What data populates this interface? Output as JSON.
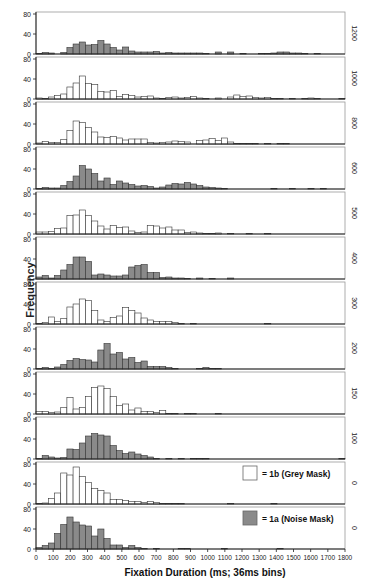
{
  "chart_data": {
    "type": "bar",
    "title": "",
    "xlabel": "Fixation Duration (ms; 36ms bins)",
    "ylabel": "Frequency",
    "right_label": "Scene Onset Delay (ms)",
    "xlim": [
      0,
      1800
    ],
    "ylim": [
      0,
      80
    ],
    "bin_width_ms": 36,
    "x_ticks": [
      0,
      100,
      200,
      300,
      400,
      500,
      600,
      700,
      800,
      900,
      1000,
      1100,
      1200,
      1300,
      1400,
      1500,
      1600,
      1700,
      1800
    ],
    "y_ticks": [
      0,
      40,
      80
    ],
    "legend": [
      {
        "label": "= 1b (Grey Mask)",
        "color": "#ffffff"
      },
      {
        "label": "= 1a (Noise Mask)",
        "color": "#8a8a8a"
      }
    ],
    "panels": [
      {
        "delay": "1200",
        "condition": "1a",
        "values": [
          1,
          3,
          2,
          0,
          3,
          13,
          20,
          24,
          18,
          19,
          27,
          20,
          13,
          8,
          14,
          6,
          4,
          4,
          4,
          5,
          2,
          3,
          2,
          2,
          2,
          2,
          2,
          1,
          0,
          4,
          0,
          4,
          0,
          1,
          0,
          0,
          1,
          1,
          2,
          4,
          4,
          2,
          2,
          1,
          0,
          1,
          0,
          0,
          0,
          0
        ]
      },
      {
        "delay": "1000",
        "condition": "1b",
        "values": [
          2,
          1,
          4,
          7,
          10,
          24,
          32,
          46,
          31,
          29,
          15,
          14,
          17,
          5,
          9,
          7,
          4,
          5,
          6,
          2,
          1,
          3,
          4,
          2,
          3,
          5,
          2,
          1,
          0,
          2,
          0,
          4,
          8,
          5,
          6,
          3,
          2,
          3,
          1,
          1,
          0,
          1,
          0,
          1,
          2,
          1,
          0,
          0,
          0,
          1
        ]
      },
      {
        "delay": "800",
        "condition": "1b",
        "values": [
          2,
          5,
          3,
          3,
          9,
          27,
          46,
          43,
          33,
          24,
          14,
          13,
          15,
          12,
          8,
          10,
          10,
          10,
          3,
          2,
          3,
          4,
          6,
          5,
          4,
          0,
          7,
          8,
          11,
          7,
          12,
          4,
          1,
          1,
          1,
          1,
          0,
          1,
          0,
          1,
          1,
          0,
          0,
          0,
          0,
          0,
          0,
          0,
          0,
          0
        ]
      },
      {
        "delay": "600",
        "condition": "1a",
        "values": [
          1,
          3,
          2,
          2,
          7,
          15,
          26,
          47,
          40,
          31,
          16,
          22,
          9,
          16,
          12,
          9,
          6,
          7,
          5,
          2,
          4,
          8,
          11,
          10,
          13,
          10,
          7,
          4,
          3,
          2,
          1,
          0,
          0,
          0,
          0,
          0,
          0,
          0,
          1,
          0,
          0,
          1,
          0,
          0,
          1,
          0,
          1,
          0,
          0,
          0
        ]
      },
      {
        "delay": "500",
        "condition": "1b",
        "values": [
          4,
          4,
          5,
          11,
          12,
          37,
          38,
          48,
          37,
          26,
          16,
          10,
          17,
          13,
          14,
          6,
          3,
          4,
          17,
          16,
          12,
          14,
          8,
          8,
          3,
          4,
          2,
          1,
          1,
          2,
          0,
          1,
          0,
          0,
          1,
          0,
          0,
          1,
          0,
          0,
          0,
          0,
          0,
          0,
          0,
          0,
          0,
          0,
          0,
          0
        ]
      },
      {
        "delay": "400",
        "condition": "1a",
        "values": [
          4,
          7,
          2,
          7,
          18,
          29,
          44,
          44,
          35,
          8,
          10,
          8,
          6,
          6,
          8,
          24,
          27,
          29,
          13,
          13,
          3,
          4,
          2,
          2,
          1,
          0,
          2,
          0,
          1,
          0,
          0,
          2,
          0,
          0,
          0,
          0,
          0,
          0,
          0,
          0,
          0,
          0,
          0,
          0,
          0,
          0,
          0,
          0,
          0,
          0
        ]
      },
      {
        "delay": "300",
        "condition": "1b",
        "values": [
          1,
          3,
          14,
          5,
          11,
          34,
          40,
          50,
          47,
          27,
          8,
          5,
          13,
          16,
          33,
          27,
          22,
          12,
          8,
          5,
          5,
          5,
          3,
          1,
          0,
          1,
          0,
          0,
          0,
          0,
          0,
          0,
          0,
          0,
          0,
          0,
          0,
          1,
          0,
          0,
          0,
          0,
          0,
          0,
          0,
          0,
          0,
          0,
          0,
          0
        ]
      },
      {
        "delay": "200",
        "condition": "1a",
        "values": [
          1,
          3,
          1,
          4,
          9,
          17,
          21,
          19,
          18,
          14,
          38,
          51,
          30,
          33,
          20,
          23,
          13,
          16,
          5,
          5,
          5,
          3,
          1,
          0,
          0,
          0,
          1,
          3,
          1,
          1,
          0,
          0,
          0,
          0,
          0,
          0,
          0,
          0,
          0,
          0,
          0,
          0,
          0,
          0,
          0,
          0,
          0,
          0,
          0,
          0
        ]
      },
      {
        "delay": "150",
        "condition": "1b",
        "values": [
          5,
          5,
          3,
          4,
          13,
          33,
          10,
          13,
          35,
          53,
          56,
          51,
          35,
          17,
          20,
          8,
          12,
          5,
          5,
          3,
          7,
          1,
          1,
          0,
          1,
          1,
          0,
          0,
          0,
          1,
          0,
          0,
          0,
          0,
          0,
          0,
          0,
          0,
          0,
          0,
          0,
          0,
          0,
          0,
          0,
          0,
          0,
          0,
          0,
          0
        ]
      },
      {
        "delay": "100",
        "condition": "1a",
        "values": [
          1,
          7,
          4,
          2,
          3,
          20,
          19,
          32,
          46,
          51,
          48,
          46,
          27,
          17,
          11,
          14,
          10,
          7,
          4,
          1,
          0,
          1,
          0,
          1,
          0,
          1,
          1,
          1,
          0,
          0,
          0,
          0,
          0,
          0,
          0,
          0,
          0,
          0,
          0,
          0,
          0,
          0,
          0,
          0,
          0,
          0,
          0,
          0,
          0,
          1
        ]
      },
      {
        "delay": "0",
        "condition": "1b",
        "values": [
          1,
          2,
          11,
          22,
          62,
          58,
          74,
          55,
          43,
          31,
          27,
          22,
          9,
          9,
          7,
          5,
          5,
          3,
          5,
          3,
          1,
          1,
          1,
          1,
          0,
          0,
          0,
          0,
          0,
          0,
          0,
          1,
          0,
          0,
          0,
          0,
          0,
          0,
          1,
          0,
          0,
          0,
          0,
          0,
          0,
          0,
          0,
          0,
          0,
          0
        ]
      },
      {
        "delay": "0",
        "condition": "1a",
        "values": [
          3,
          7,
          12,
          31,
          49,
          64,
          54,
          48,
          46,
          26,
          40,
          21,
          8,
          8,
          3,
          7,
          3,
          1,
          0,
          1,
          0,
          0,
          0,
          1,
          1,
          0,
          0,
          0,
          0,
          0,
          1,
          0,
          0,
          0,
          0,
          0,
          0,
          0,
          0,
          1,
          0,
          0,
          0,
          0,
          0,
          0,
          0,
          0,
          0,
          0
        ]
      }
    ]
  },
  "colors": {
    "grey_fill": "#8a8a8a",
    "white_fill": "#ffffff",
    "stroke": "#333333",
    "frame": "#999999"
  }
}
